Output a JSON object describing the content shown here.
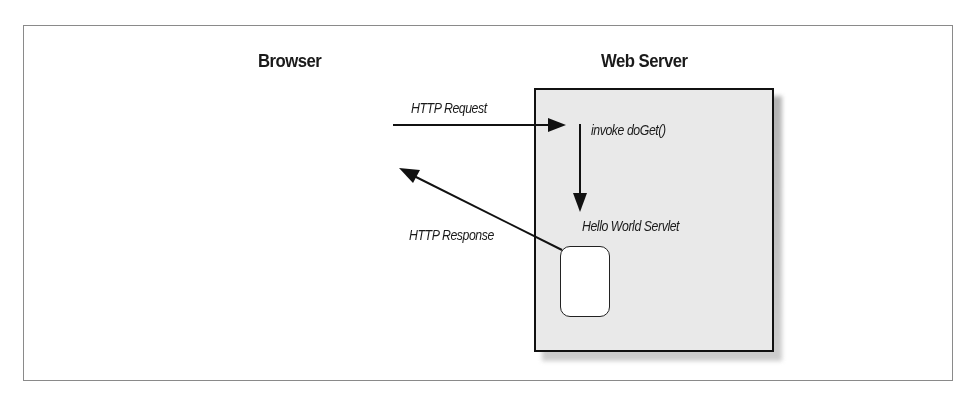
{
  "diagram": {
    "browser_heading": "Browser",
    "server_heading": "Web Server",
    "request_label": "HTTP Request",
    "invoke_label": "invoke doGet()",
    "servlet_label": "Hello World Servlet",
    "response_label": "HTTP Response",
    "colors": {
      "server_fill": "#e9e9e9",
      "stroke": "#111111",
      "frame_border": "#8a8a8a",
      "background": "#ffffff"
    }
  }
}
